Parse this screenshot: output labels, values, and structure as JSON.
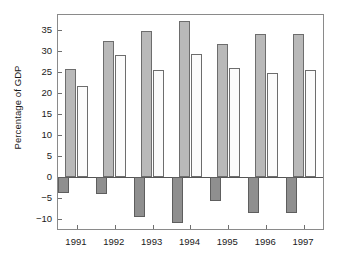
{
  "chart_data": {
    "type": "bar",
    "title": "",
    "subtitle": "",
    "xlabel": "",
    "ylabel": "Percentage of GDP",
    "categories": [
      "1991",
      "1992",
      "1993",
      "1994",
      "1995",
      "1996",
      "1997"
    ],
    "series": [
      {
        "name": "shaded-series",
        "style": "shaded-gray",
        "color": "#b9b9b9",
        "values": [
          25.7,
          32.4,
          34.8,
          37.0,
          31.5,
          33.9,
          33.9
        ]
      },
      {
        "name": "white-series",
        "style": "white",
        "color": "#fbfbfb",
        "values": [
          21.5,
          29.0,
          25.3,
          29.2,
          25.8,
          24.6,
          25.3
        ]
      },
      {
        "name": "dark-negative-series",
        "style": "dark-gray",
        "color": "#8f8f8f",
        "values": [
          -3.9,
          -4.2,
          -9.6,
          -11.0,
          -5.8,
          -8.7,
          -8.7
        ]
      }
    ],
    "ylim": [
      -12.5,
      38.5
    ],
    "yticks": [
      -10,
      -5,
      0,
      5,
      10,
      15,
      20,
      25,
      30,
      35
    ],
    "ytick_labels": [
      "−10",
      "−5",
      "0",
      "5",
      "10",
      "15",
      "20",
      "25",
      "30",
      "35"
    ],
    "grid": false,
    "legend": "none",
    "zero_line": true,
    "frame": true
  },
  "figure": {
    "background_color": "#ffffff",
    "frame_color": "#8a8a8a",
    "text_color": "#1a1a1a"
  }
}
